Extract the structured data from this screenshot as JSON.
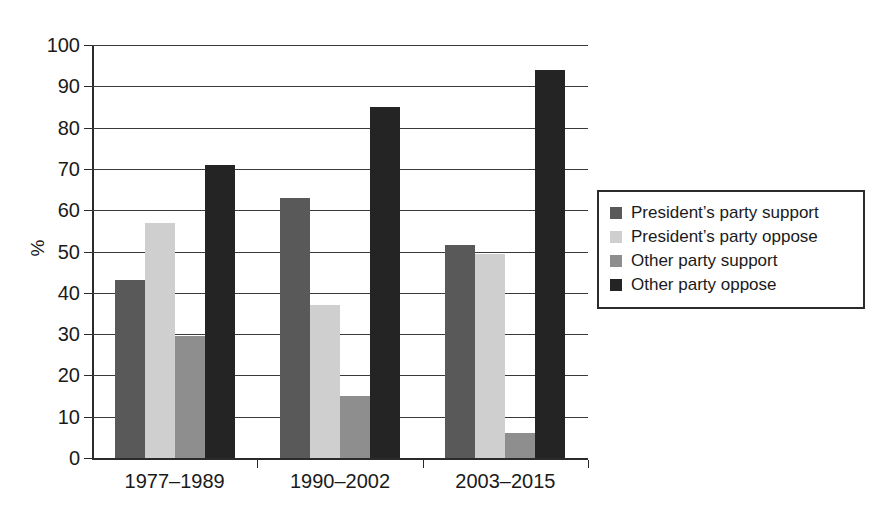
{
  "chart_data": {
    "type": "bar",
    "title": "",
    "xlabel": "",
    "ylabel": "%",
    "ylim": [
      0,
      100
    ],
    "ytick_step": 10,
    "yticks": [
      100,
      90,
      80,
      70,
      60,
      50,
      40,
      30,
      20,
      10,
      0
    ],
    "grid": true,
    "legend_position": "right",
    "categories": [
      "1977–1989",
      "1990–2002",
      "2003–2015"
    ],
    "series": [
      {
        "name": "President’s party support",
        "color": "#595959",
        "values": [
          43.0,
          63.0,
          51.5
        ]
      },
      {
        "name": "President’s party oppose",
        "color": "#cfcfcf",
        "values": [
          57.0,
          37.0,
          49.5
        ]
      },
      {
        "name": "Other party support",
        "color": "#8e8e8e",
        "values": [
          29.5,
          15.0,
          6.0
        ]
      },
      {
        "name": "Other party oppose",
        "color": "#242424",
        "values": [
          71.0,
          85.0,
          94.0
        ]
      }
    ]
  },
  "axis": {
    "y_title": "%",
    "y_tick_labels": [
      "100",
      "90",
      "80",
      "70",
      "60",
      "50",
      "40",
      "30",
      "20",
      "10",
      "0"
    ],
    "x_tick_labels": [
      "1977–1989",
      "1990–2002",
      "2003–2015"
    ]
  },
  "legend": {
    "items": [
      {
        "label": "President’s party support",
        "color": "#595959"
      },
      {
        "label": "President’s party oppose",
        "color": "#cfcfcf"
      },
      {
        "label": "Other party support",
        "color": "#8e8e8e"
      },
      {
        "label": "Other party oppose",
        "color": "#242424"
      }
    ]
  }
}
